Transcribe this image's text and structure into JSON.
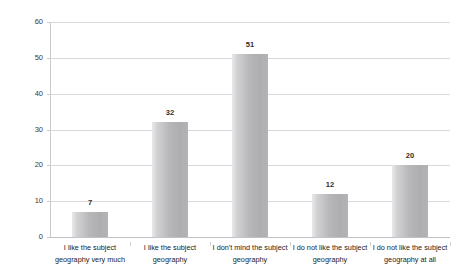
{
  "chart_data": {
    "type": "bar",
    "title": "",
    "title_note": "title row is cropped off the top edge of the screenshot and is illegible",
    "xlabel": "",
    "ylabel": "",
    "categories": [
      "I like the subject geography very much",
      "I like the subject geography",
      "I don't mind the subject geography",
      "I do not like the subject geography",
      "I do not like the subject geography at all"
    ],
    "category_lines": [
      [
        "I like the subject",
        "geography very much"
      ],
      [
        "I like the subject",
        "geography"
      ],
      [
        "I don't mind the subject",
        "geography"
      ],
      [
        "I do not like the subject",
        "geography"
      ],
      [
        "I do not like the subject",
        "geography at all"
      ]
    ],
    "values": [
      7,
      32,
      51,
      12,
      20
    ],
    "value_labels": [
      "7",
      "32",
      "51",
      "12",
      "20"
    ],
    "ylim": [
      0,
      60
    ],
    "yticks": [
      0,
      10,
      20,
      30,
      40,
      50,
      60
    ],
    "ytick_labels": [
      "0",
      "10",
      "20",
      "30",
      "40",
      "50",
      "60"
    ],
    "grid": true,
    "legend": false,
    "legend_position": "none",
    "colors": {
      "bar_light": "#e9e9eb",
      "bar_mid": "#b7b7b9",
      "bar_dark": "#aeaeb0",
      "gridline": "#d9d9dd",
      "axis": "#c9c9cd",
      "text": "#222222",
      "value_text": "#2e2e2e",
      "background": "#ffffff"
    }
  },
  "axis": {
    "y": {
      "ticks": [
        {
          "value": 60,
          "label": "60"
        },
        {
          "value": 50,
          "label": "50"
        },
        {
          "value": 40,
          "label": "40"
        },
        {
          "value": 30,
          "label": "30"
        },
        {
          "value": 20,
          "label": "20"
        },
        {
          "value": 10,
          "label": "10"
        },
        {
          "value": 0,
          "label": "0"
        }
      ]
    }
  },
  "bars": [
    {
      "label_line1": "I like the subject",
      "label_line2": "geography very much",
      "value": 7,
      "value_label": "7"
    },
    {
      "label_line1": "I like the subject",
      "label_line2": "geography",
      "value": 32,
      "value_label": "32"
    },
    {
      "label_line1": "I don't mind the subject",
      "label_line2": "geography",
      "value": 51,
      "value_label": "51"
    },
    {
      "label_line1": "I do not like the subject",
      "label_line2": "geography",
      "value": 12,
      "value_label": "12"
    },
    {
      "label_line1": "I do not like the subject",
      "label_line2": "geography at all",
      "value": 20,
      "value_label": "20"
    }
  ],
  "title": {
    "text": ""
  }
}
